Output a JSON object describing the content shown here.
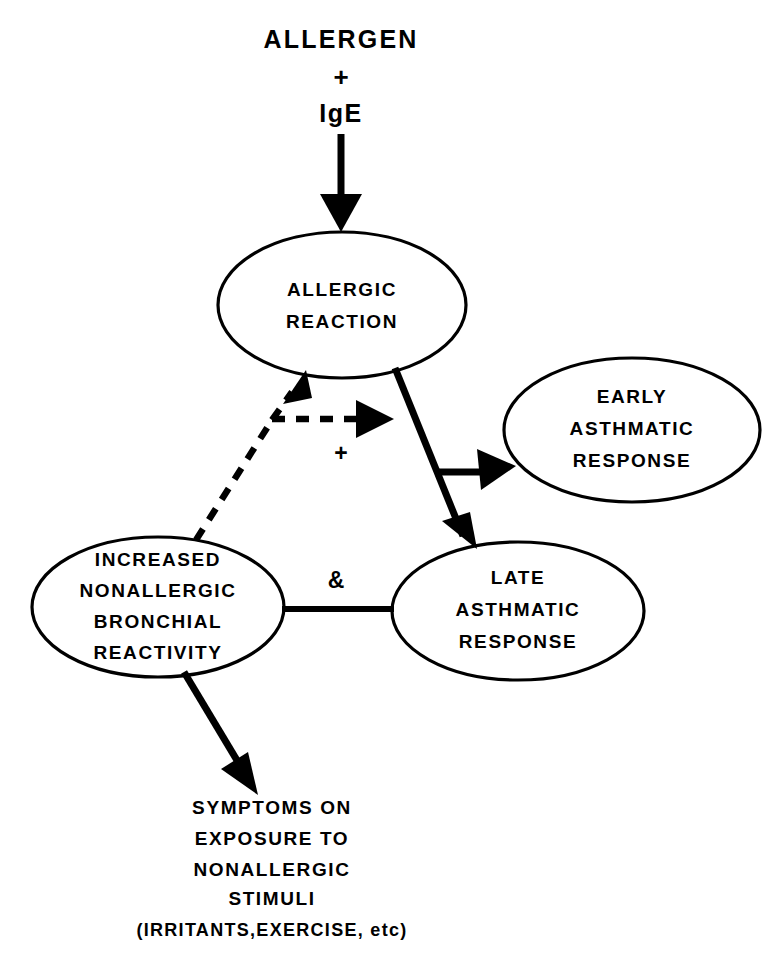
{
  "diagram": {
    "title_lines": {
      "allergen": "ALLERGEN",
      "plus": "+",
      "ige": "IgE"
    },
    "nodes": {
      "allergic_reaction": {
        "line1": "ALLERGIC",
        "line2": "REACTION"
      },
      "early_asthmatic": {
        "line1": "EARLY",
        "line2": "ASTHMATIC",
        "line3": "RESPONSE"
      },
      "increased_reactivity": {
        "line1": "INCREASED",
        "line2": "NONALLERGIC",
        "line3": "BRONCHIAL",
        "line4": "REACTIVITY"
      },
      "late_asthmatic": {
        "line1": "LATE",
        "line2": "ASTHMATIC",
        "line3": "RESPONSE"
      }
    },
    "operators": {
      "plus_feedback": "+",
      "ampersand": "&"
    },
    "outcome": {
      "line1": "SYMPTOMS ON",
      "line2": "EXPOSURE TO",
      "line3": "NONALLERGIC",
      "line4": "STIMULI",
      "line5": "(IRRITANTS,EXERCISE, etc)"
    },
    "colors": {
      "ink": "#000000",
      "background": "#ffffff"
    }
  }
}
